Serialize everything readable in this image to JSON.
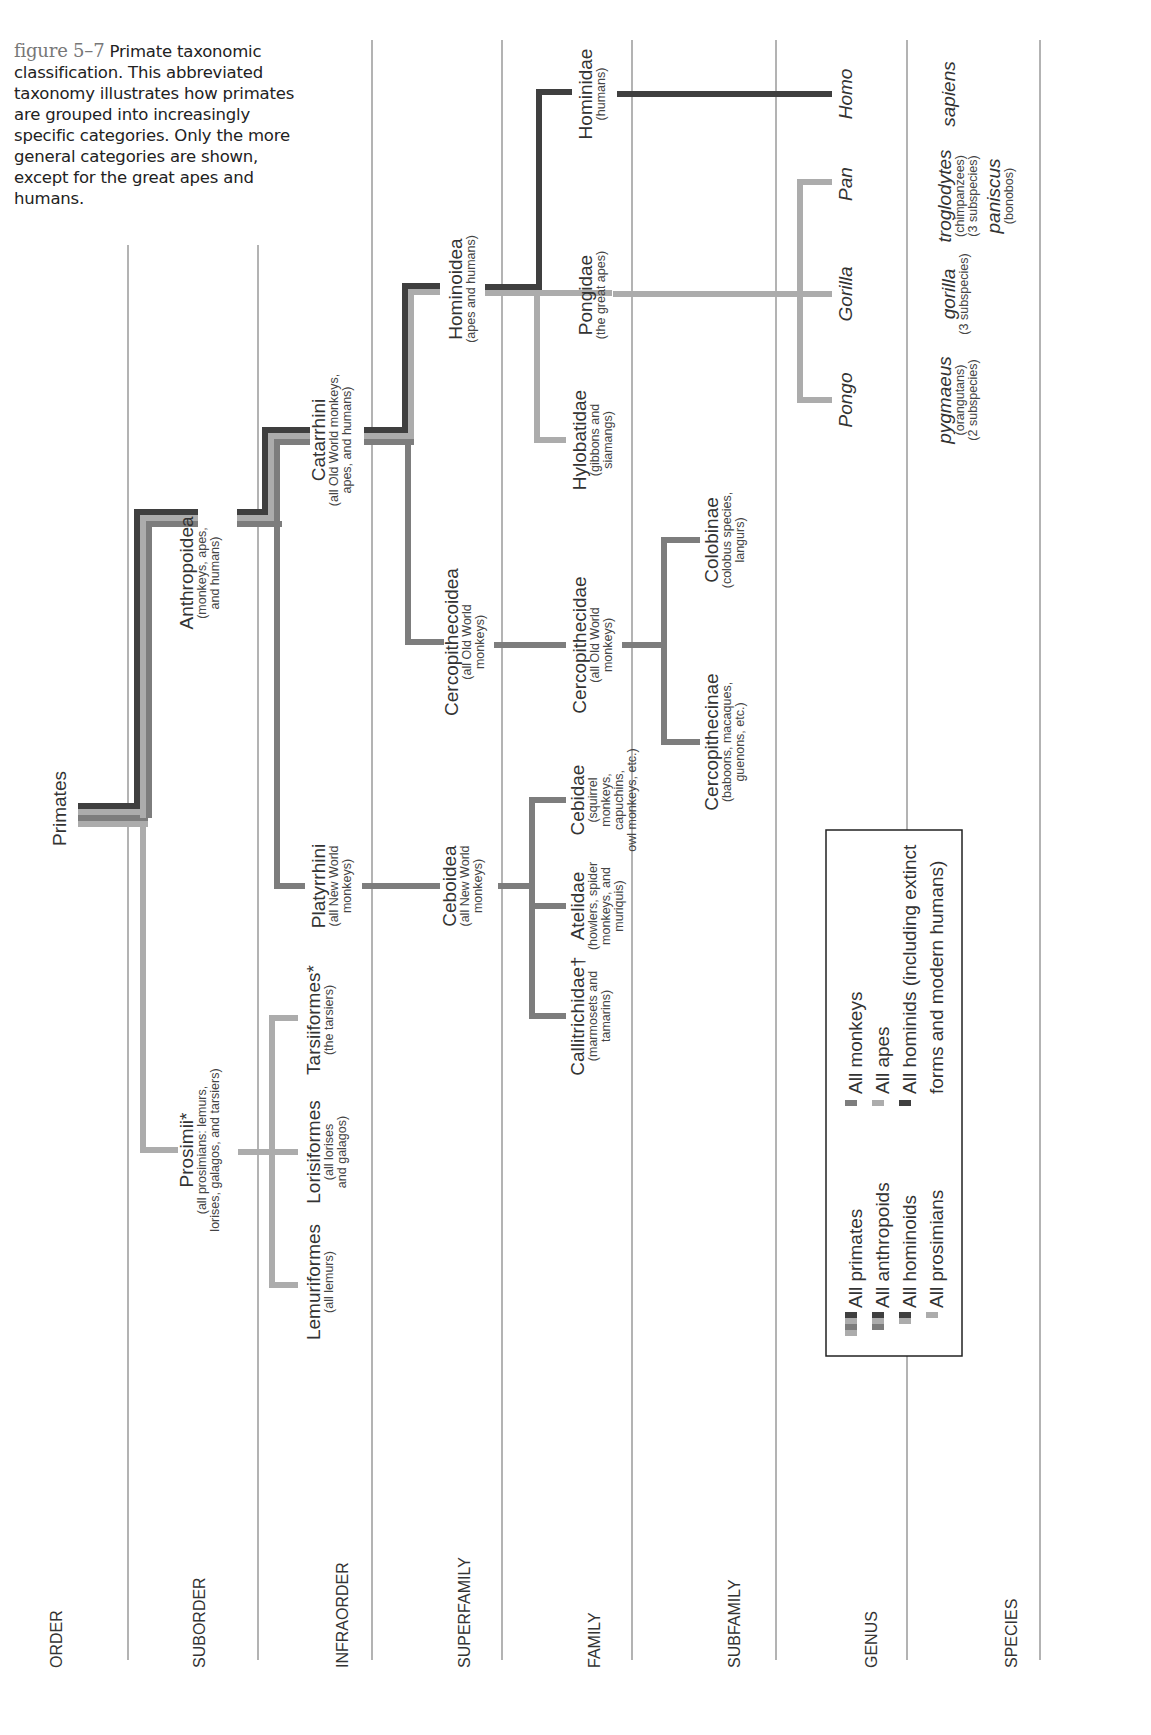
{
  "caption": {
    "figure_label": "figure 5–7",
    "text": "Primate taxonomic classification. This abbreviated taxonomy illustrates how primates are grouped into increasingly specific categories. Only the more general categories are shown, except for the great apes and humans."
  },
  "ranks": [
    "ORDER",
    "SUBORDER",
    "INFRAORDER",
    "SUPERFAMILY",
    "FAMILY",
    "SUBFAMILY",
    "GENUS",
    "SPECIES"
  ],
  "taxa": {
    "order": {
      "name": "Primates"
    },
    "anthropoidea": {
      "name": "Anthropoidea",
      "desc1": "(monkeys, apes,",
      "desc2": "and humans)"
    },
    "prosimii": {
      "name": "Prosimii*",
      "desc1": "(all prosimians: lemurs,",
      "desc2": "lorises, galagos, and tarsiers)"
    },
    "catarrhini": {
      "name": "Catarrhini",
      "desc1": "(all Old World monkeys,",
      "desc2": "apes, and humans)"
    },
    "platyrrhini": {
      "name": "Platyrrhini",
      "desc1": "(all New World",
      "desc2": "monkeys)"
    },
    "tarsiiformes": {
      "name": "Tarsiiformes*",
      "desc1": "(the tarsiers)"
    },
    "lorisiformes": {
      "name": "Lorisiformes",
      "desc1": "(all lorises",
      "desc2": "and galagos)"
    },
    "lemuriformes": {
      "name": "Lemuriformes",
      "desc1": "(all lemurs)"
    },
    "hominoidea": {
      "name": "Hominoidea",
      "desc1": "(apes and humans)"
    },
    "cercopithecoidea": {
      "name": "Cercopithecoidea",
      "desc1": "(all Old World",
      "desc2": "monkeys)"
    },
    "ceboidea": {
      "name": "Ceboidea",
      "desc1": "(all New World",
      "desc2": "monkeys)"
    },
    "hominidae": {
      "name": "Hominidae",
      "desc1": "(humans)"
    },
    "pongidae": {
      "name": "Pongidae",
      "desc1": "(the great apes)"
    },
    "hylobatidae": {
      "name": "Hylobatidae",
      "desc1": "(gibbons and",
      "desc2": "siamangs)"
    },
    "cercopithecidae": {
      "name": "Cercopithecidae",
      "desc1": "(all Old World",
      "desc2": "monkeys)"
    },
    "cebidae": {
      "name": "Cebidae",
      "desc1": "(squirrel",
      "desc2": "monkeys,",
      "desc3": "capuchins,",
      "desc4": "owl monkeys, etc.)"
    },
    "atelidae": {
      "name": "Atelidae",
      "desc1": "(howlers, spider",
      "desc2": "monkeys, and",
      "desc3": "muriquis)"
    },
    "callitrichidae": {
      "name": "Callitrichidae†",
      "desc1": "(marmosets and",
      "desc2": "tamarins)"
    },
    "colobinae": {
      "name": "Colobinae",
      "desc1": "(colobus species,",
      "desc2": "langurs)"
    },
    "cercopithecinae": {
      "name": "Cercopithecinae",
      "desc1": "(baboons, macaques,",
      "desc2": "guenons, etc.)"
    },
    "homo": {
      "name": "Homo"
    },
    "pan": {
      "name": "Pan"
    },
    "gorilla": {
      "name": "Gorilla"
    },
    "pongo": {
      "name": "Pongo"
    }
  },
  "species": {
    "sapiens": {
      "name": "sapiens"
    },
    "troglodytes": {
      "name": "troglodytes",
      "desc1": "(chimpanzees)",
      "desc2": "(3 subspecies)"
    },
    "paniscus": {
      "name": "paniscus",
      "desc1": "(bonobos)"
    },
    "gorilla": {
      "name": "gorilla",
      "desc1": "(3 subspecies)"
    },
    "pygmaeus": {
      "name": "pygmaeus",
      "desc1": "(orangutans)",
      "desc2": "(2 subspecies)"
    }
  },
  "legend": {
    "items": [
      {
        "label": "All primates"
      },
      {
        "label": "All anthropoids"
      },
      {
        "label": "All hominoids"
      },
      {
        "label": "All prosimians"
      },
      {
        "label": "All monkeys"
      },
      {
        "label": "All apes"
      },
      {
        "label": "All hominids (including extinct"
      },
      {
        "label": "forms and modern humans)"
      }
    ]
  },
  "colors": {
    "hominid": "#3f3f3f",
    "monkey": "#7d7d7d",
    "ape": "#acacac",
    "prosimian": "#acacac",
    "gridline": "#9a9a9a"
  }
}
